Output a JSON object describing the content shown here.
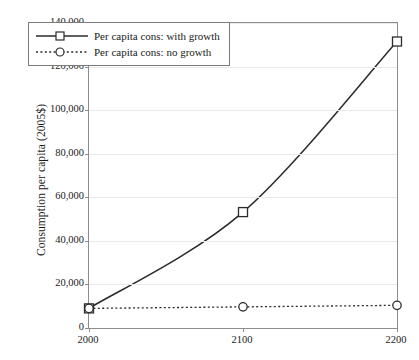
{
  "chart_data": {
    "type": "line",
    "title": "",
    "xlabel": "",
    "ylabel": "Consumption per capita (2005$)",
    "x": [
      2000,
      2100,
      2200
    ],
    "xtick_labels": [
      "2000",
      "2100",
      "2200"
    ],
    "xlim": [
      2000,
      2200
    ],
    "ylim": [
      0,
      140000
    ],
    "ytick_labels": [
      "0",
      "20,000",
      "40,000",
      "60,000",
      "80,000",
      "100,000",
      "120,000",
      "140,000"
    ],
    "ytick_values": [
      0,
      20000,
      40000,
      60000,
      80000,
      100000,
      120000,
      140000
    ],
    "grid": "horizontal",
    "legend_position": "upper-left-inside",
    "series": [
      {
        "name": "Per capita cons: with growth",
        "values": [
          9000,
          53200,
          131500
        ],
        "line_style": "solid",
        "marker": "open-square",
        "color": "#2b2b2b"
      },
      {
        "name": "Per capita cons: no growth",
        "values": [
          9000,
          9700,
          10400
        ],
        "line_style": "dotted",
        "marker": "open-circle",
        "color": "#2b2b2b"
      }
    ]
  },
  "legend": {
    "entries": [
      {
        "label": "Per capita cons: with growth",
        "marker": "open-square-icon"
      },
      {
        "label": "Per capita cons: no growth",
        "marker": "open-circle-icon"
      }
    ]
  },
  "axes": {
    "y_title": "Consumption per capita (2005$)"
  },
  "colors": {
    "series_line": "#2b2b2b",
    "gridline": "#e9e9e9",
    "axis": "#8d8d8d",
    "text": "#1a1a1a",
    "background": "#ffffff"
  }
}
